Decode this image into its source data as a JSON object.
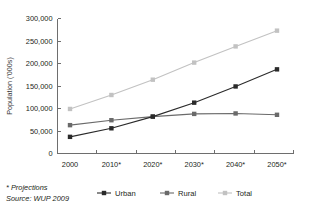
{
  "chart_data": {
    "type": "line",
    "title": "",
    "xlabel": "",
    "ylabel": "Population ('000s)",
    "categories": [
      "2000",
      "2010*",
      "2020*",
      "2030*",
      "2040*",
      "2050*"
    ],
    "ylim": [
      0,
      300000
    ],
    "yticks": [
      0,
      50000,
      100000,
      150000,
      200000,
      250000,
      300000
    ],
    "ytick_labels": [
      "0",
      "50,000",
      "100,000",
      "150,000",
      "200,000",
      "250,000",
      "300,000"
    ],
    "grid": false,
    "legend_position": "bottom",
    "series": [
      {
        "name": "Urban",
        "color": "#2a2a2a",
        "marker": "square",
        "values": [
          37000,
          56000,
          82000,
          113000,
          149000,
          187000
        ]
      },
      {
        "name": "Rural",
        "color": "#6a6a6a",
        "marker": "square",
        "values": [
          63000,
          74000,
          82000,
          88000,
          89000,
          86000
        ]
      },
      {
        "name": "Total",
        "color": "#c2c2c2",
        "marker": "square",
        "values": [
          99000,
          130000,
          164000,
          202000,
          238000,
          273000
        ]
      }
    ],
    "annotations": [
      "* Projections",
      "Source: WUP 2009"
    ]
  },
  "footnotes": {
    "projections": "* Projections",
    "source": "Source: WUP 2009"
  },
  "colors": {
    "urban": "#2a2a2a",
    "rural": "#6a6a6a",
    "total": "#c2c2c2",
    "axis": "#6e6e6e",
    "text": "#231f20",
    "background": "#ffffff"
  }
}
